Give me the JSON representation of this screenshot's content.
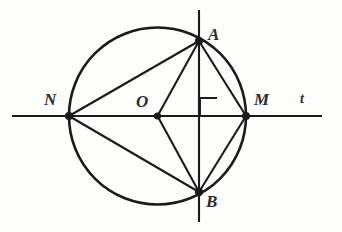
{
  "figure": {
    "background_color": "#fdfdfc",
    "ink_color": "#1a1a1a",
    "label_color": "#2b2b2b"
  },
  "labels": {
    "point_a": "A",
    "point_b": "B",
    "point_n": "N",
    "point_m": "M",
    "center_o": "O",
    "line_t": "t"
  },
  "geometry": {
    "circle": {
      "cx": 157.5,
      "cy": 116,
      "r": 88.5
    },
    "points": {
      "A": {
        "x": 199,
        "y": 41
      },
      "B": {
        "x": 199,
        "y": 192
      },
      "N": {
        "x": 69,
        "y": 116
      },
      "M": {
        "x": 246,
        "y": 116
      },
      "O": {
        "x": 157.5,
        "y": 116
      },
      "P": {
        "x": 199,
        "y": 116
      }
    },
    "horizontal_line": {
      "x1": 12,
      "y1": 116,
      "x2": 322,
      "y2": 116
    },
    "vertical_line": {
      "x1": 199,
      "y1": 10,
      "x2": 199,
      "y2": 222
    },
    "segments": [
      {
        "name": "N-A",
        "from": "N",
        "to": "A"
      },
      {
        "name": "N-B",
        "from": "N",
        "to": "B"
      },
      {
        "name": "O-A",
        "from": "O",
        "to": "A"
      },
      {
        "name": "O-B",
        "from": "O",
        "to": "B"
      },
      {
        "name": "A-M",
        "from": "A",
        "to": "M"
      },
      {
        "name": "B-M",
        "from": "B",
        "to": "M"
      }
    ],
    "right_angle_marker": {
      "x": 200,
      "y": 97,
      "size": 17
    }
  },
  "label_positions": {
    "A": {
      "left": 208,
      "top": 26
    },
    "B": {
      "left": 206,
      "top": 193
    },
    "N": {
      "left": 44,
      "top": 91
    },
    "M": {
      "left": 254,
      "top": 91
    },
    "O": {
      "left": 136,
      "top": 93
    },
    "t": {
      "left": 300,
      "top": 92
    }
  }
}
